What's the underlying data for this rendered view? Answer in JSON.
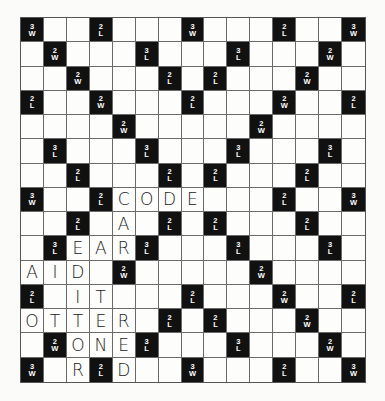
{
  "board": {
    "size": 15,
    "premium_squares": [
      {
        "row": 0,
        "col": 0,
        "num": "3",
        "kind": "W"
      },
      {
        "row": 0,
        "col": 3,
        "num": "2",
        "kind": "L"
      },
      {
        "row": 0,
        "col": 7,
        "num": "3",
        "kind": "W"
      },
      {
        "row": 0,
        "col": 11,
        "num": "2",
        "kind": "L"
      },
      {
        "row": 0,
        "col": 14,
        "num": "3",
        "kind": "W"
      },
      {
        "row": 1,
        "col": 1,
        "num": "2",
        "kind": "W"
      },
      {
        "row": 1,
        "col": 5,
        "num": "3",
        "kind": "L"
      },
      {
        "row": 1,
        "col": 9,
        "num": "3",
        "kind": "L"
      },
      {
        "row": 1,
        "col": 13,
        "num": "2",
        "kind": "W"
      },
      {
        "row": 2,
        "col": 2,
        "num": "2",
        "kind": "W"
      },
      {
        "row": 2,
        "col": 6,
        "num": "2",
        "kind": "L"
      },
      {
        "row": 2,
        "col": 8,
        "num": "2",
        "kind": "L"
      },
      {
        "row": 2,
        "col": 12,
        "num": "2",
        "kind": "W"
      },
      {
        "row": 3,
        "col": 0,
        "num": "2",
        "kind": "L"
      },
      {
        "row": 3,
        "col": 3,
        "num": "2",
        "kind": "W"
      },
      {
        "row": 3,
        "col": 7,
        "num": "2",
        "kind": "L"
      },
      {
        "row": 3,
        "col": 11,
        "num": "2",
        "kind": "W"
      },
      {
        "row": 3,
        "col": 14,
        "num": "2",
        "kind": "L"
      },
      {
        "row": 4,
        "col": 4,
        "num": "2",
        "kind": "W"
      },
      {
        "row": 4,
        "col": 10,
        "num": "2",
        "kind": "W"
      },
      {
        "row": 5,
        "col": 1,
        "num": "3",
        "kind": "L"
      },
      {
        "row": 5,
        "col": 5,
        "num": "3",
        "kind": "L"
      },
      {
        "row": 5,
        "col": 9,
        "num": "3",
        "kind": "L"
      },
      {
        "row": 5,
        "col": 13,
        "num": "3",
        "kind": "L"
      },
      {
        "row": 6,
        "col": 2,
        "num": "2",
        "kind": "L"
      },
      {
        "row": 6,
        "col": 6,
        "num": "2",
        "kind": "L"
      },
      {
        "row": 6,
        "col": 8,
        "num": "2",
        "kind": "L"
      },
      {
        "row": 6,
        "col": 12,
        "num": "2",
        "kind": "L"
      },
      {
        "row": 7,
        "col": 0,
        "num": "3",
        "kind": "W"
      },
      {
        "row": 7,
        "col": 3,
        "num": "2",
        "kind": "L"
      },
      {
        "row": 7,
        "col": 11,
        "num": "2",
        "kind": "L"
      },
      {
        "row": 7,
        "col": 14,
        "num": "3",
        "kind": "W"
      },
      {
        "row": 8,
        "col": 2,
        "num": "2",
        "kind": "L"
      },
      {
        "row": 8,
        "col": 6,
        "num": "2",
        "kind": "L"
      },
      {
        "row": 8,
        "col": 8,
        "num": "2",
        "kind": "L"
      },
      {
        "row": 8,
        "col": 12,
        "num": "2",
        "kind": "L"
      },
      {
        "row": 9,
        "col": 1,
        "num": "3",
        "kind": "L"
      },
      {
        "row": 9,
        "col": 5,
        "num": "3",
        "kind": "L"
      },
      {
        "row": 9,
        "col": 9,
        "num": "3",
        "kind": "L"
      },
      {
        "row": 9,
        "col": 13,
        "num": "3",
        "kind": "L"
      },
      {
        "row": 10,
        "col": 4,
        "num": "2",
        "kind": "W"
      },
      {
        "row": 10,
        "col": 10,
        "num": "2",
        "kind": "W"
      },
      {
        "row": 11,
        "col": 0,
        "num": "2",
        "kind": "L"
      },
      {
        "row": 11,
        "col": 7,
        "num": "2",
        "kind": "L"
      },
      {
        "row": 11,
        "col": 11,
        "num": "2",
        "kind": "W"
      },
      {
        "row": 11,
        "col": 14,
        "num": "2",
        "kind": "L"
      },
      {
        "row": 12,
        "col": 6,
        "num": "2",
        "kind": "L"
      },
      {
        "row": 12,
        "col": 8,
        "num": "2",
        "kind": "L"
      },
      {
        "row": 12,
        "col": 12,
        "num": "2",
        "kind": "W"
      },
      {
        "row": 13,
        "col": 1,
        "num": "2",
        "kind": "W"
      },
      {
        "row": 13,
        "col": 5,
        "num": "3",
        "kind": "L"
      },
      {
        "row": 13,
        "col": 9,
        "num": "3",
        "kind": "L"
      },
      {
        "row": 13,
        "col": 13,
        "num": "2",
        "kind": "W"
      },
      {
        "row": 14,
        "col": 0,
        "num": "3",
        "kind": "W"
      },
      {
        "row": 14,
        "col": 3,
        "num": "2",
        "kind": "L"
      },
      {
        "row": 14,
        "col": 7,
        "num": "3",
        "kind": "W"
      },
      {
        "row": 14,
        "col": 11,
        "num": "2",
        "kind": "L"
      },
      {
        "row": 14,
        "col": 14,
        "num": "3",
        "kind": "W"
      }
    ],
    "tiles": [
      {
        "row": 7,
        "col": 4,
        "letter": "C"
      },
      {
        "row": 7,
        "col": 5,
        "letter": "O"
      },
      {
        "row": 7,
        "col": 6,
        "letter": "D"
      },
      {
        "row": 7,
        "col": 7,
        "letter": "E"
      },
      {
        "row": 8,
        "col": 4,
        "letter": "A"
      },
      {
        "row": 9,
        "col": 2,
        "letter": "E"
      },
      {
        "row": 9,
        "col": 3,
        "letter": "A"
      },
      {
        "row": 9,
        "col": 4,
        "letter": "R"
      },
      {
        "row": 10,
        "col": 0,
        "letter": "A"
      },
      {
        "row": 10,
        "col": 1,
        "letter": "I"
      },
      {
        "row": 10,
        "col": 2,
        "letter": "D"
      },
      {
        "row": 11,
        "col": 2,
        "letter": "I"
      },
      {
        "row": 11,
        "col": 3,
        "letter": "T"
      },
      {
        "row": 12,
        "col": 0,
        "letter": "O"
      },
      {
        "row": 12,
        "col": 1,
        "letter": "T"
      },
      {
        "row": 12,
        "col": 2,
        "letter": "T"
      },
      {
        "row": 12,
        "col": 3,
        "letter": "E"
      },
      {
        "row": 12,
        "col": 4,
        "letter": "R"
      },
      {
        "row": 13,
        "col": 2,
        "letter": "O"
      },
      {
        "row": 13,
        "col": 3,
        "letter": "N"
      },
      {
        "row": 13,
        "col": 4,
        "letter": "E"
      },
      {
        "row": 14,
        "col": 2,
        "letter": "R"
      },
      {
        "row": 14,
        "col": 4,
        "letter": "D"
      }
    ],
    "words": [
      "CODE",
      "EAR",
      "AID",
      "IT",
      "OTTER",
      "ONE",
      "CARED",
      "EDITOR",
      "RE",
      "ED"
    ]
  },
  "colors": {
    "premium_bg": "#111111",
    "premium_text": "#ffffff",
    "tile_text": "#1a1a1a",
    "grid_line": "#6a6a6a"
  }
}
